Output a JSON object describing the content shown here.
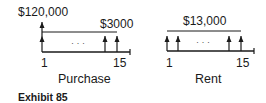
{
  "diagrams": {
    "purchase": {
      "title": "Purchase",
      "initial_amount": "$120,000",
      "periodic_amount": "$3000",
      "start_label": "1",
      "end_label": "15",
      "ellipsis": "· · ·"
    },
    "rent": {
      "title": "Rent",
      "periodic_amount": "$13,000",
      "start_label": "1",
      "end_label": "15",
      "ellipsis": "· · ·"
    }
  },
  "caption": "Exhibit 85",
  "colors": {
    "line": "#1a1a1a",
    "background": "#ffffff"
  }
}
